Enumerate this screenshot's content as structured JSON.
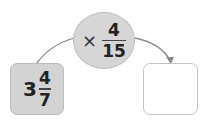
{
  "operation": {
    "operator": "×",
    "fraction": {
      "numerator": "4",
      "denominator": "15"
    }
  },
  "input": {
    "whole": "3",
    "fraction": {
      "numerator": "4",
      "denominator": "7"
    }
  },
  "output": {
    "value": ""
  },
  "colors": {
    "shape_fill": "#d6d6d6",
    "line": "#888888",
    "border": "#c4c4c4"
  }
}
